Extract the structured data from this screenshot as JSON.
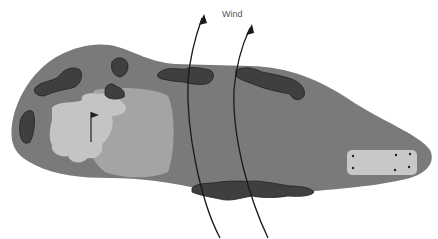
{
  "diagram": {
    "type": "golf-hole-layout",
    "wind_label": "Wind",
    "colors": {
      "rough": "#7a7a7a",
      "fairway_approach": "#a4a4a4",
      "green": "#c4c4c4",
      "tee_box": "#c8c8c8",
      "trees": "#3f3f3f",
      "arrows": "#1a1a1a",
      "background": "#ffffff"
    },
    "elements": [
      {
        "name": "hole-outline",
        "label": "rough"
      },
      {
        "name": "green",
        "label": "green"
      },
      {
        "name": "approach-area",
        "label": "fairway"
      },
      {
        "name": "flag",
        "label": "pin"
      },
      {
        "name": "tee-box",
        "label": "tee",
        "markers": 6
      },
      {
        "name": "tree-clusters",
        "count": 7
      },
      {
        "name": "wind-arrows",
        "count": 2
      }
    ]
  }
}
